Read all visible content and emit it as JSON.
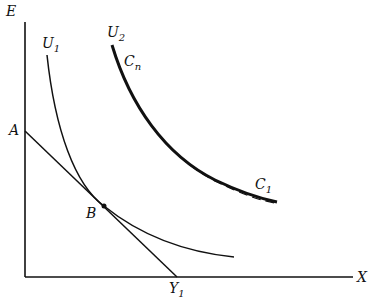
{
  "diagram": {
    "axes": {
      "y_label": "E",
      "x_label": "X"
    },
    "points": {
      "A": "A",
      "B": "B",
      "Y1_main": "Y",
      "Y1_sub": "1"
    },
    "curves": {
      "U1_main": "U",
      "U1_sub": "1",
      "U2_main": "U",
      "U2_sub": "2",
      "Cn_main": "C",
      "Cn_sub": "n",
      "C1_main": "C",
      "C1_sub": "1"
    },
    "colors": {
      "ink": "#111111",
      "background": "#ffffff"
    }
  }
}
